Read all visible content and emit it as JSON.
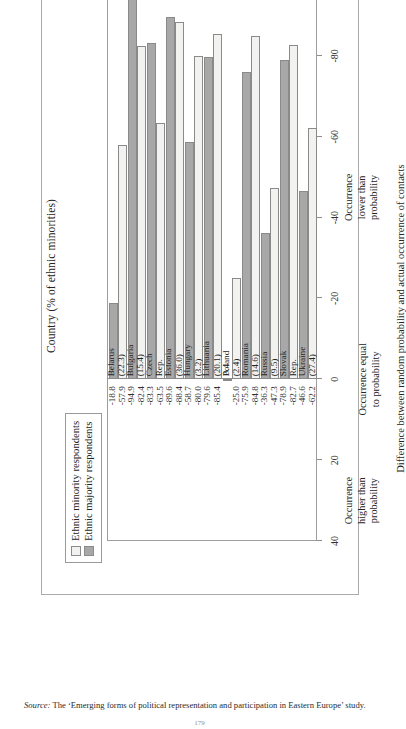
{
  "figure": {
    "axis_title": "Country (% of ethnic minorities)",
    "value_axis_title": "Difference between random probability and actual occurrence of contacts",
    "zones": [
      "Occurrence\nhigher than\nprobability",
      "Occurrence equal\nto probability",
      "Occurrence\nlower than\nprobability"
    ],
    "legend": [
      {
        "label": "Ethnic minority respondents",
        "swatch": "open-square-icon",
        "color": "#f2f2f0"
      },
      {
        "label": "Ethnic majority respondents",
        "swatch": "filled-square-icon",
        "color": "#a8a8a8"
      }
    ],
    "source_word": "Source:",
    "source_text": "The ‘Emerging forms of political representation and participation in Eastern Europe’ study.",
    "page_number": "179"
  },
  "chart_data": {
    "type": "bar",
    "orientation": "horizontal-rotated",
    "title": "Country (% of ethnic minorities)",
    "xlabel": "Country (% of ethnic minorities)",
    "ylabel": "Difference between random probability and actual occurrence of contacts",
    "ylim": [
      -100,
      40
    ],
    "yticks": [
      "40",
      "20",
      "0",
      "-20",
      "-40",
      "-60",
      "-80",
      "-100"
    ],
    "ytick_values": [
      40,
      20,
      0,
      -20,
      -40,
      -60,
      -80,
      -100
    ],
    "grid": false,
    "legend_position": "top-left",
    "categories": [
      "Belarus\n(22.3)",
      "Bulgaria\n(15.4)",
      "Czech\nRep.\n(21.0)",
      "Estonia\n(36.0)",
      "Hungary\n(3.2)",
      "Lithuania\n(20.1)",
      "Poland\n(2.4)",
      "Romania\n(14.6)",
      "Russia\n(9.5)",
      "Slovak\nRep.\n(14.2)",
      "Ukraine\n(27.4)"
    ],
    "category_names": [
      "Belarus",
      "Bulgaria",
      "Czech Rep.",
      "Estonia",
      "Hungary",
      "Lithuania",
      "Poland",
      "Romania",
      "Russia",
      "Slovak Rep.",
      "Ukraine"
    ],
    "category_minority_pct": [
      22.3,
      15.4,
      21.0,
      36.0,
      3.2,
      20.1,
      2.4,
      14.6,
      9.5,
      14.2,
      27.4
    ],
    "series": [
      {
        "name": "Ethnic minority respondents",
        "color": "#f2f2f0",
        "values": [
          -57.9,
          -82.4,
          -63.5,
          -88.4,
          -80.0,
          -85.4,
          -25.0,
          -84.8,
          -47.3,
          -82.7,
          -62.2
        ],
        "labels": [
          "-57.9",
          "-82.4",
          "-63.5",
          "-88.4",
          "-80.0",
          "-85.4",
          "-25.0",
          "-84.8",
          "-47.3",
          "-82.7",
          "-62.2"
        ]
      },
      {
        "name": "Ethnic majority respondents",
        "color": "#a8a8a8",
        "values": [
          -18.8,
          -94.9,
          -83.3,
          -89.6,
          -58.7,
          -79.6,
          0.4,
          -75.9,
          -36.3,
          -78.9,
          -46.6
        ],
        "labels": [
          "-18.8",
          "-94.9",
          "-83.3",
          "-89.6",
          "-58.7",
          "-79.6",
          "0.4",
          "-75.9",
          "-36.3",
          "-78.9",
          "-46.6"
        ]
      }
    ]
  }
}
